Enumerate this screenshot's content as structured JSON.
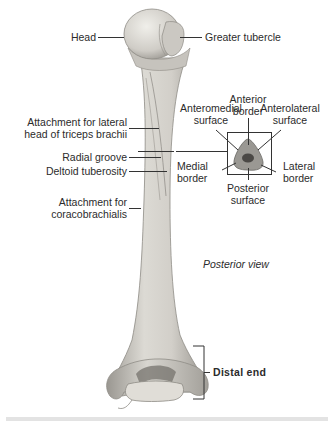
{
  "figure": {
    "view_label": "Posterior view",
    "labels": {
      "head": "Head",
      "greater_tubercle": "Greater tubercle",
      "attach_triceps_line1": "Attachment for lateral",
      "attach_triceps_line2": "head of triceps brachii",
      "radial_groove": "Radial groove",
      "deltoid_tuberosity": "Deltoid tuberosity",
      "attach_coraco_line1": "Attachment for",
      "attach_coraco_line2": "coracobrachialis",
      "distal_end": "Distal end"
    },
    "cross_section": {
      "anterior_border_line1": "Anterior",
      "anterior_border_line2": "border",
      "anteromedial_line1": "Anteromedial",
      "anteromedial_line2": "surface",
      "anterolateral_line1": "Anterolateral",
      "anterolateral_line2": "surface",
      "medial_border_line1": "Medial",
      "medial_border_line2": "border",
      "lateral_border_line1": "Lateral",
      "lateral_border_line2": "border",
      "posterior_surface_line1": "Posterior",
      "posterior_surface_line2": "surface"
    },
    "colors": {
      "bone_light": "#e4e2dc",
      "bone_mid": "#c9c6bf",
      "bone_dark": "#8f8c86",
      "leader": "#333333",
      "section_fill": "#9a9893",
      "section_core": "#4a4845"
    }
  }
}
